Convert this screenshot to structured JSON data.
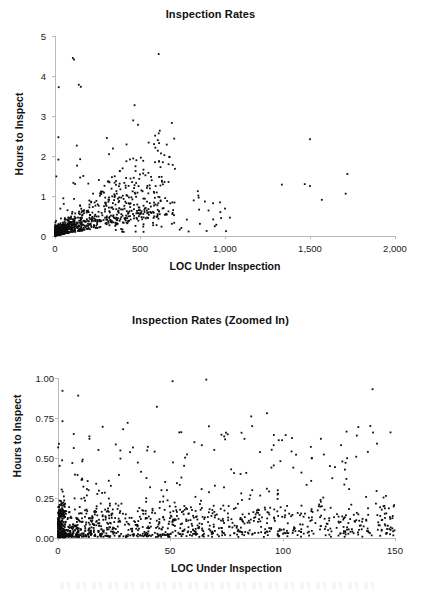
{
  "page": {
    "background_color": "#ffffff",
    "point_color": "#0d0d0d",
    "axis_color": "#b9b9b9",
    "text_color": "#111111"
  },
  "chart_data": [
    {
      "type": "scatter",
      "id": "inspection-rates-full",
      "title": "Inspection Rates",
      "xlabel": "LOC Under Inspection",
      "ylabel": "Hours to Inspect",
      "xlim": [
        0,
        2000
      ],
      "ylim": [
        0,
        5
      ],
      "xticks": [
        0,
        500,
        1000,
        1500,
        2000
      ],
      "xtick_labels": [
        "0",
        "500",
        "1,000",
        "1,500",
        "2,000"
      ],
      "yticks": [
        0,
        1,
        2,
        3,
        4,
        5
      ],
      "ytick_labels": [
        "0",
        "1",
        "2",
        "3",
        "4",
        "5"
      ],
      "grid": false,
      "legend": null,
      "marker": "square",
      "marker_size_px": 2,
      "n_points_approx": 1200,
      "description": "Dense wedge-shaped cluster of points hugging the origin with a fan of values rising from 0 to about 1.5 hours below 500 LOC; sparse high outliers above 2 hours between 20 and 500 LOC; a few isolated far-right points near 1,500 and 1,720 LOC.",
      "notable_points": [
        [
          105,
          4.45
        ],
        [
          112,
          4.41
        ],
        [
          22,
          3.72
        ],
        [
          140,
          3.78
        ],
        [
          152,
          3.73
        ],
        [
          468,
          3.27
        ],
        [
          460,
          2.89
        ],
        [
          20,
          2.47
        ],
        [
          1500,
          2.42
        ],
        [
          128,
          2.26
        ],
        [
          20,
          1.91
        ],
        [
          148,
          1.92
        ],
        [
          130,
          1.76
        ],
        [
          1720,
          1.55
        ],
        [
          8,
          1.49
        ],
        [
          148,
          1.46
        ],
        [
          335,
          1.47
        ],
        [
          258,
          1.4
        ],
        [
          1500,
          1.25
        ],
        [
          468,
          1.27
        ],
        [
          108,
          1.33
        ],
        [
          118,
          1.3
        ],
        [
          196,
          1.31
        ],
        [
          840,
          1.12
        ],
        [
          558,
          1.19
        ],
        [
          845,
          0.96
        ],
        [
          930,
          0.82
        ],
        [
          700,
          0.52
        ],
        [
          612,
          0.62
        ],
        [
          560,
          0.6
        ]
      ],
      "series": [
        {
          "name": "inspections",
          "x_range": [
            0,
            1730
          ],
          "y_range": [
            0.0,
            4.45
          ]
        }
      ]
    },
    {
      "type": "scatter",
      "id": "inspection-rates-zoomed",
      "title": "Inspection Rates (Zoomed In)",
      "xlabel": "LOC Under Inspection",
      "ylabel": "Hours to Inspect",
      "xlim": [
        0,
        150
      ],
      "ylim": [
        0.0,
        1.0
      ],
      "xticks": [
        0,
        50,
        100,
        150
      ],
      "xtick_labels": [
        "0",
        "50",
        "100",
        "150"
      ],
      "yticks": [
        0.0,
        0.25,
        0.5,
        0.75,
        1.0
      ],
      "ytick_labels": [
        "0.00",
        "0.25",
        "0.50",
        "0.75",
        "1.00"
      ],
      "grid": false,
      "legend": null,
      "marker": "square",
      "marker_size_px": 2,
      "n_points_approx": 1100,
      "description": "Zoom of the lower-left corner of the first chart. Extremely dense band below 0.20 hours, heaviest between 0 and 25 LOC, thinning gradually to the right; scattered points up to about 1.00 hour across the full LOC range.",
      "notable_points": [
        [
          2,
          0.92
        ],
        [
          9,
          0.89
        ],
        [
          51,
          0.98
        ],
        [
          66,
          0.99
        ],
        [
          140,
          0.93
        ],
        [
          44,
          0.82
        ],
        [
          93,
          0.78
        ],
        [
          86,
          0.76
        ],
        [
          2,
          0.73
        ],
        [
          31,
          0.72
        ],
        [
          29,
          0.68
        ],
        [
          139,
          0.7
        ],
        [
          7,
          0.65
        ],
        [
          148,
          0.66
        ],
        [
          54,
          0.66
        ],
        [
          83,
          0.62
        ],
        [
          117,
          0.62
        ],
        [
          133,
          0.64
        ],
        [
          14,
          0.62
        ],
        [
          142,
          0.59
        ],
        [
          64,
          0.58
        ],
        [
          96,
          0.58
        ],
        [
          40,
          0.57
        ],
        [
          18,
          0.55
        ],
        [
          43,
          0.54
        ],
        [
          113,
          0.5
        ],
        [
          99,
          0.48
        ],
        [
          128,
          0.47
        ],
        [
          95,
          0.44
        ],
        [
          11,
          0.49
        ]
      ],
      "series": [
        {
          "name": "inspections",
          "x_range": [
            0,
            150
          ],
          "y_range": [
            0.0,
            0.99
          ]
        }
      ]
    }
  ]
}
